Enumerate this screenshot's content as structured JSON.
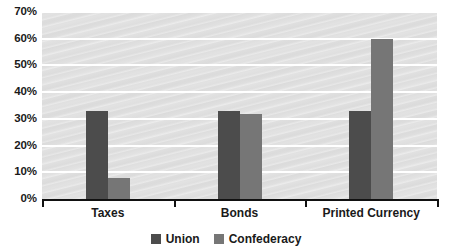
{
  "chart_data": {
    "type": "bar",
    "title": "",
    "xlabel": "",
    "ylabel": "",
    "categories": [
      "Taxes",
      "Bonds",
      "Printed Currency"
    ],
    "series": [
      {
        "name": "Union",
        "color": "#4c4c4c",
        "values": [
          33,
          33,
          33
        ]
      },
      {
        "name": "Confederacy",
        "color": "#767676",
        "values": [
          8,
          32,
          60
        ]
      }
    ],
    "ylim": [
      0,
      70
    ],
    "ytick_values": [
      0,
      10,
      20,
      30,
      40,
      50,
      60,
      70
    ],
    "ytick_labels": [
      "0%",
      "10%",
      "20%",
      "30%",
      "40%",
      "50%",
      "60%",
      "70%"
    ],
    "grid": true,
    "gridline_color": "#ffffff",
    "plot_background": "#e2e2e2",
    "legend_position": "bottom-center",
    "value_suffix": "%"
  }
}
